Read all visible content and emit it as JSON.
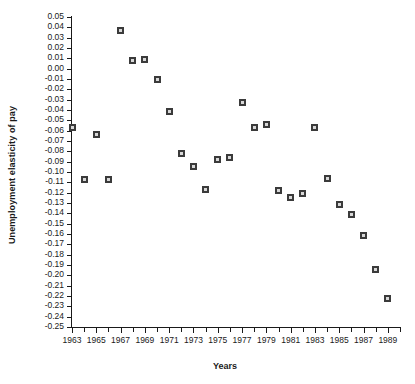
{
  "chart_data": {
    "type": "scatter",
    "title": "",
    "xlabel": "Years",
    "ylabel": "Unemployment elasticity of pay",
    "xlim": [
      1963,
      1990
    ],
    "ylim": [
      -0.25,
      0.05
    ],
    "grid": false,
    "legend": null,
    "x_tick_labels": [
      "1963",
      "1965",
      "1967",
      "1969",
      "1971",
      "1973",
      "1975",
      "1977",
      "1979",
      "1981",
      "1983",
      "1985",
      "1987",
      "1989"
    ],
    "x_tick_values": [
      1963,
      1965,
      1967,
      1969,
      1971,
      1973,
      1975,
      1977,
      1979,
      1981,
      1983,
      1985,
      1987,
      1989
    ],
    "x_minor_tick_values": [
      1964,
      1966,
      1968,
      1970,
      1972,
      1974,
      1976,
      1978,
      1980,
      1982,
      1984,
      1986,
      1988,
      1990
    ],
    "y_tick_labels": [
      "0.05",
      "0.04",
      "0.03",
      "0.02",
      "0.01",
      "0.00",
      "-0.01",
      "-0.02",
      "-0.03",
      "-0.04",
      "-0.05",
      "-0.06",
      "-0.07",
      "-0.08",
      "-0.09",
      "-0.10",
      "-0.11",
      "-0.12",
      "-0.13",
      "-0.14",
      "-0.15",
      "-0.16",
      "-0.17",
      "-0.18",
      "-0.19",
      "-0.20",
      "-0.21",
      "-0.22",
      "-0.23",
      "-0.24",
      "-0.25"
    ],
    "y_tick_values": [
      0.05,
      0.04,
      0.03,
      0.02,
      0.01,
      0.0,
      -0.01,
      -0.02,
      -0.03,
      -0.04,
      -0.05,
      -0.06,
      -0.07,
      -0.08,
      -0.09,
      -0.1,
      -0.11,
      -0.12,
      -0.13,
      -0.14,
      -0.15,
      -0.16,
      -0.17,
      -0.18,
      -0.19,
      -0.2,
      -0.21,
      -0.22,
      -0.23,
      -0.24,
      -0.25
    ],
    "x": [
      1963,
      1964,
      1965,
      1966,
      1967,
      1968,
      1969,
      1970,
      1971,
      1972,
      1973,
      1974,
      1975,
      1976,
      1977,
      1978,
      1979,
      1980,
      1981,
      1982,
      1983,
      1984,
      1985,
      1986,
      1987,
      1988,
      1989
    ],
    "y": [
      -0.057,
      -0.107,
      -0.064,
      -0.107,
      0.037,
      0.008,
      0.009,
      -0.01,
      -0.041,
      -0.082,
      -0.095,
      -0.117,
      -0.088,
      -0.086,
      -0.033,
      -0.057,
      -0.054,
      -0.118,
      -0.125,
      -0.121,
      -0.057,
      -0.106,
      -0.131,
      -0.141,
      -0.161,
      -0.194,
      -0.222
    ],
    "points": [
      {
        "x": 1963,
        "y": -0.057
      },
      {
        "x": 1964,
        "y": -0.107
      },
      {
        "x": 1965,
        "y": -0.064
      },
      {
        "x": 1966,
        "y": -0.107
      },
      {
        "x": 1967,
        "y": 0.037
      },
      {
        "x": 1968,
        "y": 0.008
      },
      {
        "x": 1969,
        "y": 0.009
      },
      {
        "x": 1970,
        "y": -0.01
      },
      {
        "x": 1971,
        "y": -0.041
      },
      {
        "x": 1972,
        "y": -0.082
      },
      {
        "x": 1973,
        "y": -0.095
      },
      {
        "x": 1974,
        "y": -0.117
      },
      {
        "x": 1975,
        "y": -0.088
      },
      {
        "x": 1976,
        "y": -0.086
      },
      {
        "x": 1977,
        "y": -0.033
      },
      {
        "x": 1978,
        "y": -0.057
      },
      {
        "x": 1979,
        "y": -0.054
      },
      {
        "x": 1980,
        "y": -0.118
      },
      {
        "x": 1981,
        "y": -0.125
      },
      {
        "x": 1982,
        "y": -0.121
      },
      {
        "x": 1983,
        "y": -0.057
      },
      {
        "x": 1984,
        "y": -0.106
      },
      {
        "x": 1985,
        "y": -0.131
      },
      {
        "x": 1986,
        "y": -0.141
      },
      {
        "x": 1987,
        "y": -0.161
      },
      {
        "x": 1988,
        "y": -0.194
      },
      {
        "x": 1989,
        "y": -0.222
      }
    ],
    "marker": {
      "shape": "square",
      "edge_color": "#3b3b3b",
      "face_color": "#d8d8d8",
      "size_px": 7
    }
  }
}
